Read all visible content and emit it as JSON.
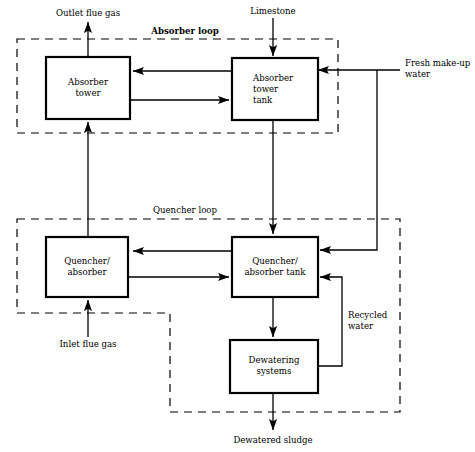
{
  "diagram": {
    "stroke_color": "#000000",
    "background_color": "#ffffff",
    "boxes": [
      {
        "id": "absorber_tower",
        "lines": [
          "Absorber",
          "tower"
        ],
        "align": "center"
      },
      {
        "id": "absorber_tower_tank",
        "lines": [
          "Absorber",
          "tower",
          "tank"
        ],
        "align": "left"
      },
      {
        "id": "quencher_absorber",
        "lines": [
          "Quencher/",
          "absorber"
        ],
        "align": "center"
      },
      {
        "id": "quencher_tank",
        "lines": [
          "Quencher/",
          "absorber tank"
        ],
        "align": "center"
      },
      {
        "id": "dewatering_systems",
        "lines": [
          "Dewatering",
          "systems"
        ],
        "align": "center"
      }
    ],
    "loops": [
      {
        "id": "absorber_loop",
        "label": "Absorber loop",
        "bold": true
      },
      {
        "id": "quencher_loop",
        "label": "Quencher loop",
        "bold": false
      }
    ],
    "streams": [
      {
        "id": "outlet_flue_gas",
        "label": "Outlet flue gas",
        "direction": "out"
      },
      {
        "id": "limestone",
        "label": "Limestone",
        "direction": "in"
      },
      {
        "id": "fresh_makeup",
        "label": [
          "Fresh make-up",
          "water"
        ],
        "direction": "in"
      },
      {
        "id": "inlet_flue_gas",
        "label": "Inlet flue gas",
        "direction": "in"
      },
      {
        "id": "recycled_water",
        "label": [
          "Recycled",
          "water"
        ],
        "direction": "internal"
      },
      {
        "id": "dewatered_sludge",
        "label": "Dewatered sludge",
        "direction": "out"
      }
    ]
  }
}
